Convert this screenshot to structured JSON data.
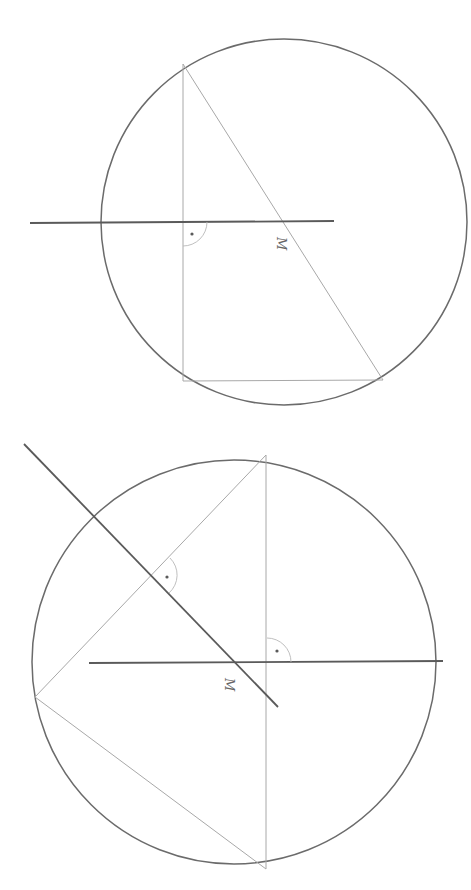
{
  "figure": {
    "colors": {
      "background": "#ffffff",
      "circle": "#6b6b6b",
      "bisector": "#5a5a5a",
      "triangle": "#a8a8a8",
      "angle_mark": "#b8b8b8"
    }
  },
  "diagrams": [
    {
      "id": "top",
      "caption": "Right triangle inscribed in circle; hypotenuse passes through center M",
      "center_label": "M",
      "circle": {
        "cx": 284,
        "cy": 222,
        "r": 183
      },
      "triangle": {
        "vertices": [
          [
            183,
            64
          ],
          [
            183,
            381
          ],
          [
            383,
            380
          ]
        ]
      },
      "bisectors": [
        {
          "x1": 30,
          "y1": 223,
          "x2": 334,
          "y2": 221
        }
      ],
      "right_angle_marks": [
        {
          "x": 183,
          "y": 222,
          "dot": [
            189,
            234
          ]
        }
      ],
      "label_pos": [
        280,
        240
      ]
    },
    {
      "id": "bottom",
      "caption": "Triangle inscribed in circle; two perpendicular bisectors intersect at center M",
      "center_label": "M",
      "circle": {
        "cx": 234,
        "cy": 662,
        "r": 202
      },
      "triangle": {
        "vertices": [
          [
            266,
            455
          ],
          [
            35,
            697
          ],
          [
            266,
            869
          ]
        ]
      },
      "bisectors": [
        {
          "x1": 89,
          "y1": 663,
          "x2": 443,
          "y2": 661
        },
        {
          "x1": 24,
          "y1": 444,
          "x2": 278,
          "y2": 707
        }
      ],
      "right_angle_marks": [
        {
          "x": 267,
          "y": 662,
          "dot": [
            277,
            651
          ]
        },
        {
          "x": 152,
          "y": 576,
          "dot": [
            167,
            577
          ]
        }
      ],
      "label_pos": [
        230,
        684
      ]
    }
  ]
}
